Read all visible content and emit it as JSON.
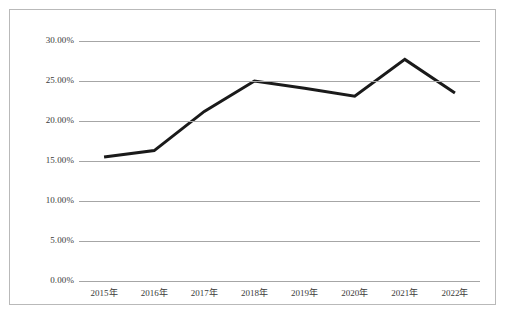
{
  "chart_data": {
    "type": "line",
    "title": "",
    "subtitle": "",
    "xlabel": "",
    "ylabel": "",
    "categories": [
      "2015年",
      "2016年",
      "2017年",
      "2018年",
      "2019年",
      "2020年",
      "2021年",
      "2022年"
    ],
    "values": [
      15.5,
      16.3,
      21.2,
      25.0,
      24.1,
      23.1,
      27.7,
      23.5
    ],
    "series": [
      {
        "name": "",
        "values": [
          15.5,
          16.3,
          21.2,
          25.0,
          24.1,
          23.1,
          27.7,
          23.5
        ]
      }
    ],
    "y_tick_labels": [
      "30.00%",
      "25.00%",
      "20.00%",
      "15.00%",
      "10.00%",
      "5.00%",
      "0.00%"
    ],
    "y_tick_values": [
      30,
      25,
      20,
      15,
      10,
      5,
      0
    ],
    "ylim": [
      0,
      30
    ],
    "y_unit": "%",
    "grid": true,
    "grid_axis": "y",
    "legend": "none",
    "line_color": "#1a1a1a",
    "gridline_color": "#a6a6a6",
    "border_color": "#b9b9b9",
    "background_color": "#ffffff",
    "markers": false,
    "line_width": 3
  }
}
